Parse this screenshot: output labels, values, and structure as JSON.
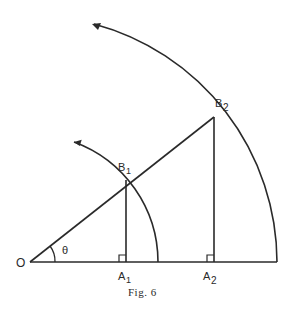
{
  "figure": {
    "caption": "Fig. 6",
    "labels": {
      "origin": "O",
      "angle": "θ",
      "a1": "A",
      "a1_sub": "1",
      "a2": "A",
      "a2_sub": "2",
      "b1": "B",
      "b1_sub": "1",
      "b2": "B",
      "b2_sub": "2"
    }
  }
}
